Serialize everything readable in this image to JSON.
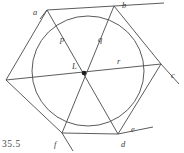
{
  "figure": {
    "caption": "35.5",
    "caption_pos": {
      "x": 2,
      "y": 140
    },
    "center_label": "L",
    "background_color": "#ffffff",
    "stroke_color": "#4a4a4a",
    "label_color": "#3a3a3a",
    "vertex_labels": [
      {
        "id": "a",
        "text": "a",
        "x": 33,
        "y": 8
      },
      {
        "id": "b",
        "text": "b",
        "x": 122,
        "y": 1
      },
      {
        "id": "c",
        "text": "c",
        "x": 171,
        "y": 71
      },
      {
        "id": "d",
        "text": "d",
        "x": 121,
        "y": 140
      },
      {
        "id": "e",
        "text": "e",
        "x": 131,
        "y": 125
      },
      {
        "id": "f",
        "text": "f",
        "x": 54,
        "y": 140
      }
    ],
    "segment_labels": [
      {
        "id": "p",
        "text": "p",
        "x": 60,
        "y": 35
      },
      {
        "id": "q",
        "text": "q",
        "x": 98,
        "y": 35
      },
      {
        "id": "r",
        "text": "r",
        "x": 117,
        "y": 57
      },
      {
        "id": "L",
        "text": "L",
        "x": 72,
        "y": 62
      }
    ],
    "circle": {
      "cx": 88,
      "cy": 71,
      "r": 55
    },
    "center_dot": {
      "cx": 84,
      "cy": 73,
      "r": 2.2
    },
    "hexagon_vertices": [
      {
        "id": "a",
        "x": 47,
        "y": 10
      },
      {
        "id": "b",
        "x": 114,
        "y": 6
      },
      {
        "id": "c",
        "x": 161,
        "y": 64
      },
      {
        "id": "d",
        "x": 118,
        "y": 134
      },
      {
        "id": "f",
        "x": 62,
        "y": 133
      },
      {
        "id": "g",
        "x": 6,
        "y": 80
      }
    ],
    "diagonals": [
      {
        "from": "a",
        "to": "d"
      },
      {
        "from": "b",
        "to": "f"
      },
      {
        "from": "c",
        "to": "g"
      }
    ],
    "extension_lines": [
      {
        "id": "top-extension",
        "x1": 114,
        "y1": 6,
        "x2": 162,
        "y2": 3
      },
      {
        "id": "right-extension",
        "x1": 161,
        "y1": 64,
        "x2": 178,
        "y2": 83
      },
      {
        "id": "bottom-extension",
        "x1": 118,
        "y1": 134,
        "x2": 152,
        "y2": 127
      },
      {
        "id": "bottom-left-extension",
        "x1": 62,
        "y1": 133,
        "x2": 72,
        "y2": 149
      }
    ]
  }
}
